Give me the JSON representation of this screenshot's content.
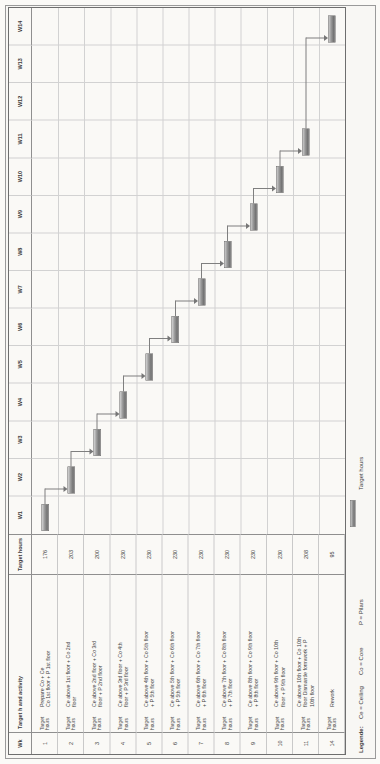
{
  "header": {
    "wk": "Wk",
    "activity": "Target h and activity",
    "hours": "Target hours"
  },
  "labels": {
    "row_sublabel": "Target hours"
  },
  "weeks": [
    "W1",
    "W2",
    "W3",
    "W4",
    "W5",
    "W6",
    "W7",
    "W8",
    "W9",
    "W10",
    "W11",
    "W12",
    "W13",
    "W14"
  ],
  "rows": [
    {
      "wk": "1",
      "lines": [
        "Prepare Co + Ce",
        "Co 1st floor + P 1st floor"
      ],
      "hours": "176"
    },
    {
      "wk": "2",
      "lines": [
        "Ce above 1st floor + Co 2nd",
        "floor"
      ],
      "hours": "203"
    },
    {
      "wk": "3",
      "lines": [
        "Ce above 2nd floor + Co 3rd",
        "floor + P 2nd floor"
      ],
      "hours": "200"
    },
    {
      "wk": "4",
      "lines": [
        "Ce above 3rd floor + Co 4th",
        "floor + P 3rd floor"
      ],
      "hours": "230"
    },
    {
      "wk": "5",
      "lines": [
        "Ce above 4th floor + Co 5th floor",
        "+ P 5th floor"
      ],
      "hours": "230"
    },
    {
      "wk": "6",
      "lines": [
        "Ce above 5th floor + Co 6th floor",
        "+ P 5th floor"
      ],
      "hours": "230"
    },
    {
      "wk": "7",
      "lines": [
        "Ce above 6th floor + Co 7th floor",
        "+ P 6th floor"
      ],
      "hours": "230"
    },
    {
      "wk": "8",
      "lines": [
        "Ce above 7th floor + Co 8th floor",
        "+ P 7th floor"
      ],
      "hours": "230"
    },
    {
      "wk": "9",
      "lines": [
        "Ce above 8th floor + Co 9th floor",
        "+ P 8th floor"
      ],
      "hours": "230"
    },
    {
      "wk": "10",
      "lines": [
        "Ce above 9th floor + Co 10th",
        "floor + P 9th floor"
      ],
      "hours": "230"
    },
    {
      "wk": "11",
      "lines": [
        "Ce above 10th floor + Co 10th",
        "floor Dismantle formwork + P",
        "10th floor"
      ],
      "hours": "208"
    },
    {
      "wk": "14",
      "lines": [
        "Rework"
      ],
      "hours": "95"
    }
  ],
  "legend": {
    "title": "Legende:",
    "items": [
      "Ce = Ceiling",
      "Co = Core",
      "P = Pilars"
    ],
    "bar_label": "Target hours"
  },
  "chart_data": {
    "type": "bar",
    "subtype": "gantt",
    "note": "Landscape Gantt chart printed rotated 90 degrees counter-clockwise on a portrait page; one bar per task in its week column, finish-to-start arrow links between consecutive tasks",
    "categories": [
      "W1",
      "W2",
      "W3",
      "W4",
      "W5",
      "W6",
      "W7",
      "W8",
      "W9",
      "W10",
      "W11",
      "W12",
      "W13",
      "W14"
    ],
    "tasks": [
      {
        "wk": "1",
        "week": "W1",
        "activity": "Prepare Co + Ce Co 1st floor + P 1st floor",
        "target_hours": 176
      },
      {
        "wk": "2",
        "week": "W2",
        "activity": "Ce above 1st floor + Co 2nd floor",
        "target_hours": 203
      },
      {
        "wk": "3",
        "week": "W3",
        "activity": "Ce above 2nd floor + Co 3rd floor + P 2nd floor",
        "target_hours": 200
      },
      {
        "wk": "4",
        "week": "W4",
        "activity": "Ce above 3rd floor + Co 4th floor + P 3rd floor",
        "target_hours": 230
      },
      {
        "wk": "5",
        "week": "W5",
        "activity": "Ce above 4th floor + Co 5th floor + P 5th floor",
        "target_hours": 230
      },
      {
        "wk": "6",
        "week": "W6",
        "activity": "Ce above 5th floor + Co 6th floor + P 5th floor",
        "target_hours": 230
      },
      {
        "wk": "7",
        "week": "W7",
        "activity": "Ce above 6th floor + Co 7th floor + P 6th floor",
        "target_hours": 230
      },
      {
        "wk": "8",
        "week": "W8",
        "activity": "Ce above 7th floor + Co 8th floor + P 7th floor",
        "target_hours": 230
      },
      {
        "wk": "9",
        "week": "W9",
        "activity": "Ce above 8th floor + Co 9th floor + P 8th floor",
        "target_hours": 230
      },
      {
        "wk": "10",
        "week": "W10",
        "activity": "Ce above 9th floor + Co 10th floor + P 9th floor",
        "target_hours": 230
      },
      {
        "wk": "11",
        "week": "W11",
        "activity": "Ce above 10th floor + Co 10th floor Dismantle formwork + P 10th floor",
        "target_hours": 208
      },
      {
        "wk": "14",
        "week": "W14",
        "activity": "Rework",
        "target_hours": 95
      }
    ],
    "links": [
      [
        0,
        1
      ],
      [
        1,
        2
      ],
      [
        2,
        3
      ],
      [
        3,
        4
      ],
      [
        4,
        5
      ],
      [
        5,
        6
      ],
      [
        6,
        7
      ],
      [
        7,
        8
      ],
      [
        8,
        9
      ],
      [
        9,
        10
      ],
      [
        10,
        11
      ]
    ],
    "legend_position": "bottom"
  }
}
